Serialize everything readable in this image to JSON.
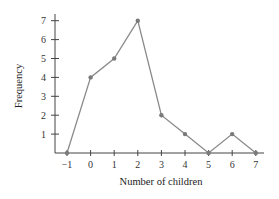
{
  "chart_data": {
    "type": "line",
    "title": "",
    "xlabel": "Number of children",
    "ylabel": "Frequency",
    "x": [
      -1,
      0,
      1,
      2,
      3,
      4,
      5,
      6,
      7
    ],
    "series": [
      {
        "name": "Frequency",
        "values": [
          0,
          4,
          5,
          7,
          2,
          1,
          0,
          1,
          0
        ]
      }
    ],
    "x_ticks": [
      -1,
      0,
      1,
      2,
      3,
      4,
      5,
      6,
      7
    ],
    "y_ticks": [
      1,
      2,
      3,
      4,
      5,
      6,
      7
    ],
    "xlim": [
      -1,
      7
    ],
    "ylim": [
      0,
      7.5
    ],
    "grid": false,
    "legend": "none"
  },
  "style": {
    "line_color": "#8a8a8a",
    "marker_color": "#7a7a7a",
    "axis_color": "#444444"
  }
}
